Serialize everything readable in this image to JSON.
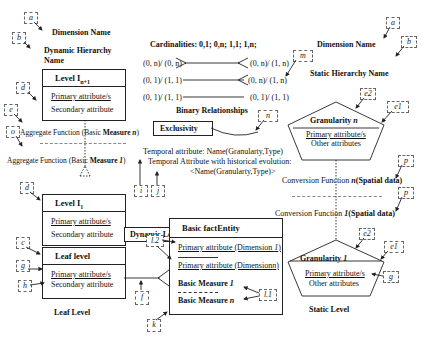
{
  "left": {
    "dimension_name": "Dimension Name",
    "dynamic_hierarchy_name_1": "Dynamic Hierarchy",
    "dynamic_hierarchy_name_2": "Name",
    "level_n1": {
      "title": "Level I",
      "sub": "n+1",
      "primary": "Primary attribute/s",
      "secondary": "Secondary attribute"
    },
    "aggregate_n": "Aggregate Function (Basic Measure n)",
    "aggregate_1": "Aggregate Function (Basic Measure 1)",
    "level_1": {
      "title": "Level I",
      "sub": "1",
      "primary": "Primary attribute/s",
      "secondary": "Secondary attribute"
    },
    "leaf": {
      "title": "Leaf level",
      "primary": "Primary attribute/s",
      "secondary": "Secondary attribute"
    },
    "leaf_level_label": "Leaf Level",
    "dynamic_level_label": "Dynamic Level"
  },
  "center": {
    "cardinalities": "Cardinalities:  0,1;  0,n;  1,1;  1,n;",
    "rel_rows": [
      {
        "left": "(0, n)/ (0, n)",
        "right": "(0, n)/ (1, n)"
      },
      {
        "left": "(0, 1)/ (1, 1)",
        "right": "(0, n)/ (1, n)"
      },
      {
        "left": "(0, 1)/ (1, 1)",
        "right": "(0, 1)/ (1, 1)"
      }
    ],
    "binary_relationships": "Binary Relationships",
    "exclusivity": "Exclusivity",
    "temporal_1": "Temporal attribute: Name(Granularty,Type)",
    "temporal_2": "Temporal Attribute with historical evolution:",
    "temporal_3": "<Name(Granularty,Type)>",
    "fact": {
      "title": "Basic factEntity",
      "primary_1": "Primary attribute (Dimension 1)",
      "primary_n": "Primary attribute (Dimension n)",
      "measure_1": "Basic Measure 1",
      "measure_n": "Basic Measure n"
    }
  },
  "right": {
    "dimension_name": "Dimension Name",
    "static_hierarchy_name": "Static Hierarchy Name",
    "gran_n": {
      "title": "Granularity n",
      "primary": "Primary attribute/s",
      "other": "Other attributes"
    },
    "conversion_n": "Conversion Function n(Spatial data)",
    "conversion_1": "Conversion Function 1(Spatial data)",
    "gran_1": {
      "title": "Granularity 1",
      "primary": "Primary attribute/s",
      "other": "Other attributes"
    },
    "static_level_label": "Static Level"
  },
  "tags": {
    "a": "a",
    "b": "b",
    "c": "c",
    "d": "d",
    "e": "e",
    "f": "f",
    "g": "g",
    "h": "h",
    "i": "i",
    "j": "j",
    "k": "k",
    "l1": "l.1",
    "l2": "l.2",
    "m": "m",
    "n": "n",
    "o": "o",
    "p": "p",
    "q": "q",
    "e1": "e1",
    "e2": "e2"
  }
}
